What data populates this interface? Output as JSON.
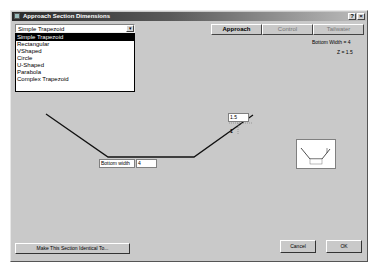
{
  "window": {
    "title": "Approach Section Dimensions",
    "help_label": "?",
    "close_label": "×"
  },
  "section_type": {
    "selected": "Simple Trapezoid",
    "arrow": "▾",
    "options": [
      "Simple Trapezoid",
      "Rectangular",
      "VShaped",
      "Circle",
      "U-Shaped",
      "Parabola",
      "Complex Trapezoid"
    ]
  },
  "tabs": [
    {
      "label": "Approach",
      "active": true
    },
    {
      "label": "Control",
      "active": false
    },
    {
      "label": "Tailwater",
      "active": false
    }
  ],
  "info": {
    "bottom_width": "Bottom Width = 4",
    "z": "Z = 1.5"
  },
  "drawing": {
    "bottom_width_label": "Bottom width",
    "bottom_width_value": "4",
    "side_slope_value": "1.5",
    "vertical_marker": "1",
    "thumbnail_label": "bottom"
  },
  "buttons": {
    "make_identical": "Make This Section Identical To...",
    "cancel": "Cancel",
    "ok": "OK"
  }
}
